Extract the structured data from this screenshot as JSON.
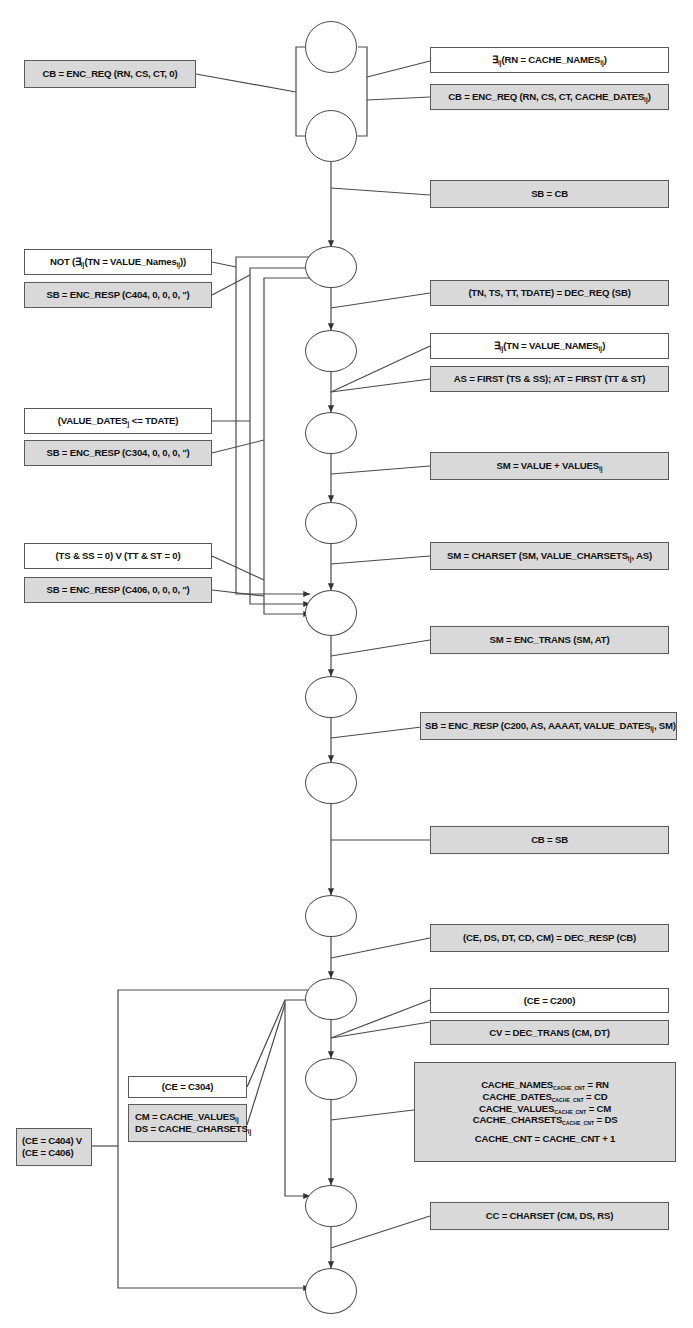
{
  "diagram": {
    "colors": {
      "shaded_fill": "#d9d9d9",
      "plain_fill": "#ffffff",
      "stroke": "#4a4a4a"
    }
  },
  "nodes": [
    {
      "id": "n1",
      "name": "node-start"
    },
    {
      "id": "n2",
      "name": "node-2"
    },
    {
      "id": "n3",
      "name": "node-3"
    },
    {
      "id": "n4",
      "name": "node-4"
    },
    {
      "id": "n5",
      "name": "node-5"
    },
    {
      "id": "n6",
      "name": "node-6"
    },
    {
      "id": "n7",
      "name": "node-7"
    },
    {
      "id": "n8",
      "name": "node-8"
    },
    {
      "id": "n9",
      "name": "node-9"
    },
    {
      "id": "n10",
      "name": "node-10"
    },
    {
      "id": "n11",
      "name": "node-11"
    },
    {
      "id": "n12",
      "name": "node-12"
    },
    {
      "id": "n13",
      "name": "node-13"
    },
    {
      "id": "n14",
      "name": "node-end"
    }
  ],
  "labels": {
    "cb_enc_req_0": "CB = ENC_REQ (RN, CS, CT, 0)",
    "exists_rn_cache_names": {
      "pre": "∃",
      "sub": "ij",
      "mid": "(RN = CACHE_NAMES",
      "sub2": "ij",
      "post": ")"
    },
    "cb_enc_req_cache_dates": {
      "pre": "CB = ENC_REQ (RN, CS, CT, CACHE_DATES",
      "sub": "ij",
      "post": ")"
    },
    "sb_eq_cb": "SB = CB",
    "not_exists_tn_value_names": {
      "pre": "NOT (∃",
      "sub": "ij",
      "mid": "(TN = VALUE_Names",
      "sub2": "ij",
      "post": "))"
    },
    "sb_enc_resp_404": "SB = ENC_RESP (C404, 0, 0, 0, '')",
    "dec_req": "(TN, TS, TT, TDATE) = DEC_REQ (SB)",
    "exists_tn_value_names": {
      "pre": "∃",
      "sub": "ij",
      "mid": "(TN = VALUE_NAMES",
      "sub2": "ij",
      "post": ")"
    },
    "as_at_first": "AS = FIRST (TS & SS); AT = FIRST (TT & ST)",
    "value_dates_lte_tdate": {
      "pre": "(VALUE_DATES",
      "sub": "j",
      "post": " <= TDATE)"
    },
    "sb_enc_resp_304": "SB = ENC_RESP (C304, 0, 0, 0, '')",
    "sm_value_plus_values": {
      "pre": "SM = VALUE + VALUES",
      "sub": "ij",
      "post": ""
    },
    "ts_ss_tt_st_zero": "(TS & SS = 0) V (TT & ST = 0)",
    "sb_enc_resp_406": "SB = ENC_RESP (C406, 0, 0, 0, '')",
    "sm_charset": {
      "pre": "SM = CHARSET (SM, VALUE_CHARSETS",
      "sub": "ij",
      "post": ", AS)"
    },
    "sm_enc_trans": "SM = ENC_TRANS (SM, AT)",
    "sb_enc_resp_200": {
      "pre": "SB = ENC_RESP (C200, AS, AAAAT, VALUE_DATES",
      "sub": "ij",
      "post": ", SM)"
    },
    "cb_eq_sb": "CB = SB",
    "dec_resp": "(CE, DS, DT, CD, CM) = DEC_RESP (CB)",
    "ce_eq_c200": "(CE = C200)",
    "cv_dec_trans": "CV = DEC_TRANS (CM, DT)",
    "ce_eq_c304": "(CE = C304)",
    "cm_cache_values": {
      "pre": "CM = CACHE_VALUES",
      "sub": "ij",
      "post": ""
    },
    "ds_cache_charsets": {
      "pre": "DS = CACHE_CHARSETS",
      "sub": "ij",
      "post": ""
    },
    "ce_404_line1": "(CE = C404) V",
    "ce_406_line2": "(CE = C406)",
    "cache_names_assign": {
      "pre": "CACHE_NAMES",
      "sub": "CACHE_CNT",
      "post": " = RN"
    },
    "cache_dates_assign": {
      "pre": "CACHE_DATES",
      "sub": "CACHE_CNT",
      "post": " = CD"
    },
    "cache_values_assign": {
      "pre": "CACHE_VALUES",
      "sub": "CACHE_CNT",
      "post": " = CM"
    },
    "cache_charsets_assign": {
      "pre": "CACHE_CHARSETS",
      "sub": "CACHE_CNT",
      "post": " = DS"
    },
    "cache_cnt_incr": "CACHE_CNT = CACHE_CNT + 1",
    "cc_charset": "CC = CHARSET (CM, DS, RS)"
  }
}
